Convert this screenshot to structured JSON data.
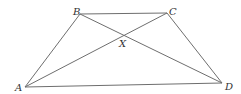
{
  "figure": {
    "type": "trapezoid-with-diagonals",
    "points": {
      "A": {
        "label": "A",
        "x": 25,
        "y": 87
      },
      "B": {
        "label": "B",
        "x": 80,
        "y": 14
      },
      "C": {
        "label": "C",
        "x": 167,
        "y": 13
      },
      "D": {
        "label": "D",
        "x": 222,
        "y": 83
      },
      "X": {
        "label": "X",
        "x": 124,
        "y": 36
      }
    },
    "segments": [
      "AB",
      "BC",
      "CD",
      "DA",
      "AC",
      "BD"
    ],
    "colors": {
      "line": "#6e6e6e",
      "label": "#333333",
      "background": "#ffffff"
    }
  }
}
